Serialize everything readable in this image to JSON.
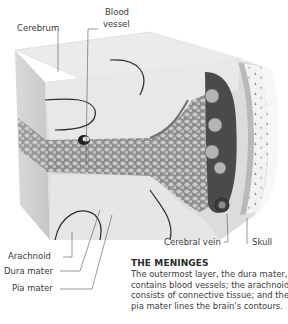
{
  "diagram": {
    "labels": {
      "cerebrum": "Cerebrum",
      "blood_vessel_line1": "Blood",
      "blood_vessel_line2": "vessel",
      "arachnoid": "Arachnoid",
      "dura_mater": "Dura mater",
      "pia_mater": "Pia mater",
      "cerebral_vein": "Cerebral vein",
      "skull": "Skull"
    },
    "colors": {
      "brain_surface": "#e6e6e6",
      "brain_side": "#d2d2d2",
      "arachnoid_mesh": "#9a9a9a",
      "dark_sinus": "#4a4a4a",
      "skull": "#f0f0f0",
      "leader_line": "#555555"
    }
  },
  "caption": {
    "title": "THE MENINGES",
    "body": "The outermost layer, the dura mater, contains blood vessels; the arachnoid consists of connective tissue; and the pia mater lines the brain's contours."
  }
}
